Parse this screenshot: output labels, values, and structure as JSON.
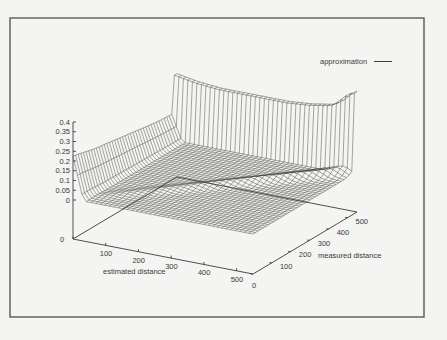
{
  "figure": {
    "background": "#f4f4f2",
    "frame_color": "#5a5a5a",
    "line_color": "#3c3c3c"
  },
  "chart_data": {
    "type": "surface3d",
    "title": "",
    "legend": [
      {
        "label": "approximation",
        "style": "solid-line"
      }
    ],
    "legend_position": "top-right",
    "x_axis": {
      "label": "estimated distance",
      "ticks": [
        0,
        100,
        200,
        300,
        400,
        500
      ],
      "range": [
        0,
        550
      ]
    },
    "y_axis": {
      "label": "measured distance",
      "ticks": [
        0,
        100,
        200,
        300,
        400,
        500
      ],
      "range": [
        0,
        550
      ]
    },
    "z_axis": {
      "label": "",
      "ticks": [
        0,
        0.05,
        0.1,
        0.15,
        0.2,
        0.25,
        0.3,
        0.35,
        0.4
      ],
      "range": [
        0,
        0.4
      ]
    },
    "grid": false,
    "surface_profile": {
      "back_wall_height": [
        0.33,
        0.31,
        0.3,
        0.3,
        0.3,
        0.3,
        0.31,
        0.33,
        0.38
      ],
      "left_ripple_height": [
        0.25,
        0.22,
        0.2,
        0.18,
        0.16,
        0.15
      ],
      "floor_level": 0.0
    },
    "grid_resolution": 40
  }
}
